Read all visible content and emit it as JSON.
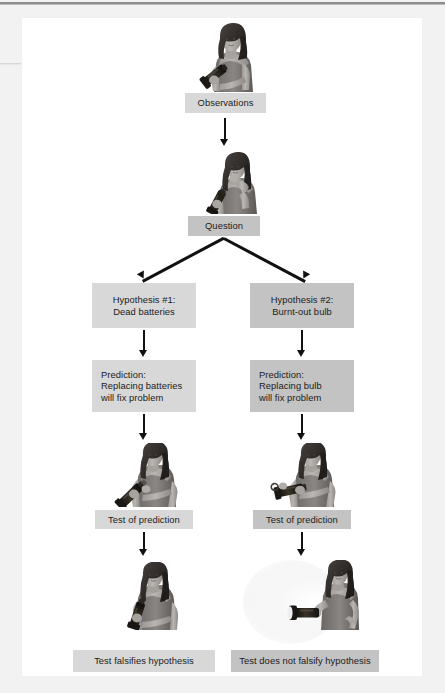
{
  "figure": {
    "background_color": "#ffffff",
    "page_color": "#ffffff",
    "scan_margin_color": "#f2f2f2",
    "box_tone_light": "#d8d8d8",
    "box_tone_dark": "#c3c3c3",
    "arrow_color": "#111111",
    "text_color": "#1b1b1b"
  },
  "boxes": {
    "observations": {
      "label": "Observations",
      "tone": "light",
      "align": "center"
    },
    "question": {
      "label": "Question",
      "tone": "dark",
      "align": "center"
    },
    "hypothesis_1": {
      "label": "Hypothesis #1:\nDead batteries",
      "tone": "light",
      "align": "center"
    },
    "hypothesis_2": {
      "label": "Hypothesis #2:\nBurnt-out bulb",
      "tone": "dark",
      "align": "center"
    },
    "prediction_1": {
      "label": "Prediction:\nReplacing batteries\nwill fix problem",
      "tone": "light",
      "align": "left"
    },
    "prediction_2": {
      "label": "Prediction:\nReplacing bulb\nwill fix problem",
      "tone": "dark",
      "align": "left"
    },
    "test_1": {
      "label": "Test of prediction",
      "tone": "light",
      "align": "center"
    },
    "test_2": {
      "label": "Test of prediction",
      "tone": "dark",
      "align": "center"
    },
    "result_1": {
      "label": "Test falsifies hypothesis",
      "tone": "light",
      "align": "center"
    },
    "result_2": {
      "label": "Test does not falsify hypothesis",
      "tone": "dark",
      "align": "center"
    }
  },
  "photos": {
    "observation_photo": {
      "name": "woman-holding-dark-flashlight",
      "caption_role": "observation"
    },
    "question_photo": {
      "name": "woman-puzzled-hand-on-chin-with-flashlight",
      "caption_role": "question"
    },
    "test_photo_left": {
      "name": "woman-replacing-batteries-in-flashlight",
      "caption_role": "test-prediction-1"
    },
    "test_photo_right": {
      "name": "woman-replacing-bulb-in-flashlight",
      "caption_role": "test-prediction-2"
    },
    "result_photo_left": {
      "name": "woman-with-flashlight-still-dark",
      "caption_role": "falsified"
    },
    "result_photo_right": {
      "name": "woman-with-flashlight-shining-beam",
      "caption_role": "not-falsified"
    }
  },
  "flow_structure": {
    "type": "flowchart",
    "nodes": [
      "Observations",
      "Question",
      "Hypothesis #1: Dead batteries",
      "Hypothesis #2: Burnt-out bulb",
      "Prediction: Replacing batteries will fix problem",
      "Prediction: Replacing bulb will fix problem",
      "Test of prediction",
      "Test of prediction",
      "Test falsifies hypothesis",
      "Test does not falsify hypothesis"
    ],
    "branch_point": "Question"
  }
}
